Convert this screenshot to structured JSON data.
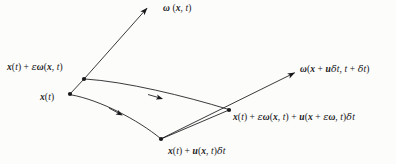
{
  "figure": {
    "background_color": "#fcfcfb",
    "stroke_color": "#18181a",
    "width": 396,
    "height": 164
  },
  "labels": {
    "omega_top": {
      "text": "ω (x, t)",
      "parts": [
        "ω",
        "(",
        "x",
        ",",
        "t",
        ")"
      ],
      "role": "vector-omega-at-x-t"
    },
    "omega_right": {
      "text": "ω(x + uδt, t + δt)",
      "role": "vector-omega-advected"
    },
    "x_plus_eps_omega": {
      "text": "x(t) + εω(x, t)",
      "role": "perturbed-position"
    },
    "x_of_t": {
      "text": "x(t)",
      "role": "base-position"
    },
    "x_plus_u_dt": {
      "text": "x(t) + u(x, t)δt",
      "role": "advected-base-position"
    },
    "x_full": {
      "text": "x(t) + εω(x, t) + u(x + εω, t)δt",
      "role": "advected-perturbed-position"
    }
  },
  "nodes": [
    {
      "name": "node-x-plus-eps-omega",
      "x": 84,
      "y": 79,
      "label": "x(t) + εω(x, t)"
    },
    {
      "name": "node-x-of-t",
      "x": 70,
      "y": 94,
      "label": "x(t)"
    },
    {
      "name": "node-x-plus-u-dt",
      "x": 161,
      "y": 139,
      "label": "x(t) + u(x, t)δt"
    },
    {
      "name": "node-x-full",
      "x": 229,
      "y": 110,
      "label": "x(t) + εω(x, t) + u(x + εω, t)δt"
    }
  ],
  "arrows": [
    {
      "name": "arrow-omega-at-x",
      "from": [
        84,
        79
      ],
      "to": [
        148,
        7
      ],
      "style": "straight",
      "label": "ω (x, t)"
    },
    {
      "name": "arrow-omega-advected",
      "from": [
        161,
        139
      ],
      "to": [
        296,
        72
      ],
      "style": "straight",
      "label": "ω(x + uδt, t + δt)"
    },
    {
      "name": "arrow-upper-trajectory",
      "from": [
        84,
        79
      ],
      "to": [
        229,
        110
      ],
      "style": "curved",
      "label": ""
    },
    {
      "name": "arrow-lower-trajectory",
      "from": [
        70,
        94
      ],
      "to": [
        161,
        139
      ],
      "style": "curved",
      "label": ""
    }
  ],
  "segments": [
    {
      "name": "segment-initial-line",
      "from": [
        70,
        94
      ],
      "to": [
        84,
        79
      ]
    },
    {
      "name": "segment-final-line",
      "from": [
        161,
        139
      ],
      "to": [
        229,
        110
      ]
    }
  ]
}
